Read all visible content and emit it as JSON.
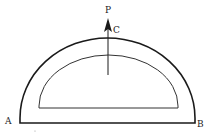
{
  "diagram": {
    "type": "semicircular protractor with arrow",
    "labels": {
      "P": "P",
      "C": "C",
      "A": "A",
      "B": "B"
    },
    "stroke_color": "#1a1a1a",
    "background": "#ffffff"
  }
}
